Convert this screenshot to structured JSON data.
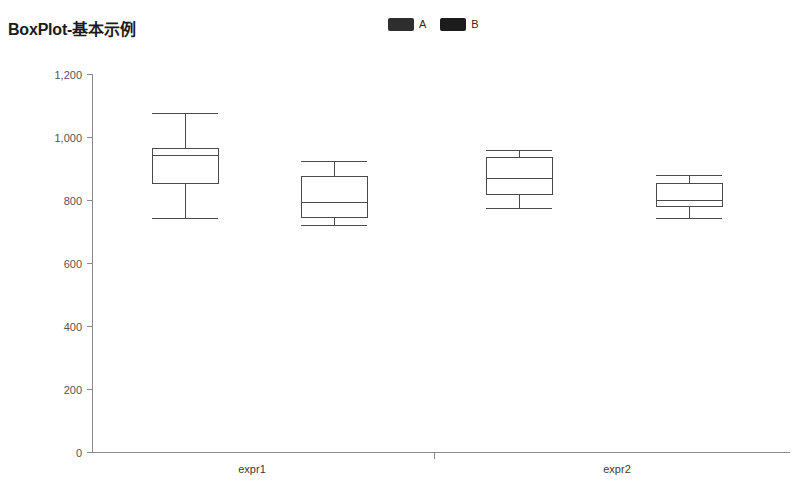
{
  "chart": {
    "title": "BoxPlot-基本示例"
  },
  "legend": {
    "position": "top-center",
    "items": [
      {
        "label": "A",
        "color": "#2e2e2e"
      },
      {
        "label": "B",
        "color": "#1c1c1c"
      }
    ]
  },
  "chart_data": {
    "type": "box",
    "title": "BoxPlot-基本示例",
    "xlabel": "",
    "ylabel": "",
    "grid": false,
    "legend_position": "top-center",
    "categories": [
      "expr1",
      "expr2"
    ],
    "y_ticks": [
      "0",
      "200",
      "400",
      "600",
      "800",
      "1,000",
      "1,200"
    ],
    "y_tick_values": [
      0,
      200,
      400,
      600,
      800,
      1000,
      1200
    ],
    "ylim": [
      0,
      1200
    ],
    "series": [
      {
        "name": "A",
        "color": "#2e2e2e",
        "boxes": [
          {
            "category": "expr1",
            "min": 743,
            "q1": 854,
            "median": 943,
            "q3": 965,
            "max": 1076
          },
          {
            "category": "expr2",
            "min": 775,
            "q1": 819,
            "median": 870,
            "q3": 937,
            "max": 959
          }
        ]
      },
      {
        "name": "B",
        "color": "#1c1c1c",
        "boxes": [
          {
            "category": "expr1",
            "min": 721,
            "q1": 746,
            "median": 794,
            "q3": 876,
            "max": 923
          },
          {
            "category": "expr2",
            "min": 743,
            "q1": 781,
            "median": 800,
            "q3": 854,
            "max": 880
          }
        ]
      }
    ]
  },
  "axes": {
    "x_axis_y_px": 452,
    "y_axis_x_px": 92,
    "plot_right_px": 790,
    "plot_top_px": 74,
    "box_centers_px": [
      185,
      334,
      519,
      689
    ],
    "box_half_width_px": 33,
    "category_label_positions_px": [
      252,
      617
    ],
    "category_divider_px": 434
  }
}
